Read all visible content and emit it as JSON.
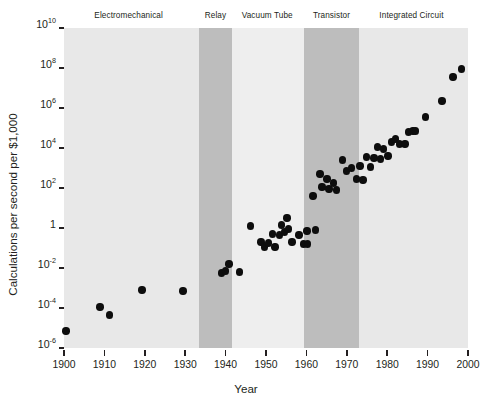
{
  "chart_data": {
    "type": "scatter",
    "title": "",
    "xlabel": "Year",
    "ylabel": "Calculations per second per $1,000",
    "xlim": [
      1900,
      2000
    ],
    "ylim_log10": [
      -6,
      10
    ],
    "yscale": "log",
    "grid": false,
    "legend": "none",
    "xticks": [
      1900,
      1910,
      1920,
      1930,
      1940,
      1950,
      1960,
      1970,
      1980,
      1990,
      2000
    ],
    "xtick_labels": [
      "1900",
      "1910",
      "1920",
      "1930",
      "1940",
      "1950",
      "1960",
      "1970",
      "1980",
      "1990",
      "2000"
    ],
    "yticks_log10": [
      10,
      8,
      6,
      4,
      2,
      0,
      -2,
      -4,
      -6
    ],
    "ytick_labels": [
      {
        "mantissa": "10",
        "exp": "10"
      },
      {
        "mantissa": "10",
        "exp": "8"
      },
      {
        "mantissa": "10",
        "exp": "6"
      },
      {
        "mantissa": "10",
        "exp": "4"
      },
      {
        "mantissa": "10",
        "exp": "2"
      },
      {
        "mantissa": "1",
        "exp": ""
      },
      {
        "mantissa": "10",
        "exp": "-2"
      },
      {
        "mantissa": "10",
        "exp": "-4"
      },
      {
        "mantissa": "10",
        "exp": "-6"
      }
    ],
    "bands": [
      {
        "label": "Electromechanical",
        "x0": 1900,
        "x1": 1933.5,
        "color": "#e8e8e8",
        "label_x": 1916.0
      },
      {
        "label": "Relay",
        "x0": 1933.5,
        "x1": 1941.5,
        "color": "#bdbdbd",
        "label_x": 1937.5
      },
      {
        "label": "Vacuum Tube",
        "x0": 1941.5,
        "x1": 1959.5,
        "color": "#eeeeee",
        "label_x": 1950.3
      },
      {
        "label": "Transistor",
        "x0": 1959.5,
        "x1": 1973.0,
        "color": "#bdbdbd",
        "label_x": 1966.2
      },
      {
        "label": "Integrated Circuit",
        "x0": 1973.0,
        "x1": 2000.0,
        "color": "#e8e8e8",
        "label_x": 1986.0
      }
    ],
    "point_color": "#0d0d0d",
    "points": [
      {
        "year": 1900.5,
        "log10y": -5.15
      },
      {
        "year": 1908.9,
        "log10y": -3.95
      },
      {
        "year": 1911.2,
        "log10y": -4.35
      },
      {
        "year": 1919.3,
        "log10y": -3.1
      },
      {
        "year": 1929.5,
        "log10y": -3.15
      },
      {
        "year": 1939.0,
        "log10y": -2.25
      },
      {
        "year": 1939.9,
        "log10y": -2.15
      },
      {
        "year": 1940.8,
        "log10y": -1.8
      },
      {
        "year": 1943.4,
        "log10y": -2.2
      },
      {
        "year": 1946.2,
        "log10y": 0.1
      },
      {
        "year": 1948.8,
        "log10y": -0.7
      },
      {
        "year": 1949.6,
        "log10y": -0.95
      },
      {
        "year": 1950.6,
        "log10y": -0.75
      },
      {
        "year": 1951.6,
        "log10y": -0.3
      },
      {
        "year": 1952.2,
        "log10y": -0.95
      },
      {
        "year": 1953.3,
        "log10y": -0.35
      },
      {
        "year": 1953.9,
        "log10y": 0.15
      },
      {
        "year": 1954.6,
        "log10y": -0.2
      },
      {
        "year": 1955.2,
        "log10y": 0.5
      },
      {
        "year": 1955.6,
        "log10y": -0.05
      },
      {
        "year": 1956.4,
        "log10y": -0.7
      },
      {
        "year": 1958.2,
        "log10y": -0.35
      },
      {
        "year": 1959.3,
        "log10y": -0.8
      },
      {
        "year": 1960.1,
        "log10y": -0.15
      },
      {
        "year": 1960.3,
        "log10y": -0.8
      },
      {
        "year": 1962.2,
        "log10y": -0.1
      },
      {
        "year": 1961.6,
        "log10y": 1.6
      },
      {
        "year": 1963.4,
        "log10y": 2.7
      },
      {
        "year": 1963.9,
        "log10y": 2.05
      },
      {
        "year": 1965.1,
        "log10y": 2.45
      },
      {
        "year": 1965.6,
        "log10y": 1.95
      },
      {
        "year": 1966.7,
        "log10y": 2.25
      },
      {
        "year": 1967.4,
        "log10y": 1.9
      },
      {
        "year": 1968.9,
        "log10y": 3.4
      },
      {
        "year": 1969.9,
        "log10y": 2.85
      },
      {
        "year": 1971.2,
        "log10y": 3.0
      },
      {
        "year": 1972.4,
        "log10y": 2.45
      },
      {
        "year": 1973.3,
        "log10y": 3.1
      },
      {
        "year": 1974.0,
        "log10y": 2.4
      },
      {
        "year": 1974.9,
        "log10y": 3.55
      },
      {
        "year": 1975.8,
        "log10y": 3.05
      },
      {
        "year": 1976.7,
        "log10y": 3.5
      },
      {
        "year": 1977.6,
        "log10y": 4.05
      },
      {
        "year": 1978.4,
        "log10y": 3.45
      },
      {
        "year": 1979.1,
        "log10y": 3.95
      },
      {
        "year": 1980.2,
        "log10y": 3.6
      },
      {
        "year": 1981.1,
        "log10y": 4.3
      },
      {
        "year": 1982.0,
        "log10y": 4.45
      },
      {
        "year": 1983.1,
        "log10y": 4.2
      },
      {
        "year": 1984.4,
        "log10y": 4.2
      },
      {
        "year": 1985.3,
        "log10y": 4.8
      },
      {
        "year": 1986.4,
        "log10y": 4.85
      },
      {
        "year": 1987.0,
        "log10y": 4.85
      },
      {
        "year": 1989.5,
        "log10y": 5.55
      },
      {
        "year": 1993.6,
        "log10y": 6.35
      },
      {
        "year": 1996.3,
        "log10y": 7.55
      },
      {
        "year": 1998.4,
        "log10y": 7.95
      }
    ]
  }
}
